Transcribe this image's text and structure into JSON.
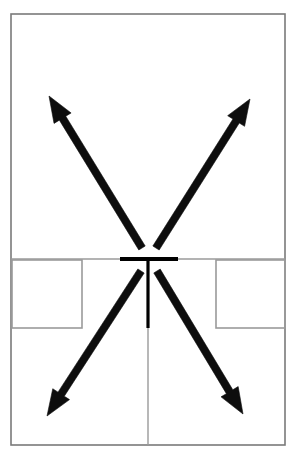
{
  "diagram": {
    "canvas": {
      "width": 296,
      "height": 458,
      "background_color": "#ffffff"
    },
    "colors": {
      "outline": "#7a7a7a",
      "wall_light": "#9a9a9a",
      "wall_dark": "#000000",
      "arrow": "#0d0d0d",
      "background": "#ffffff"
    },
    "outer_wall": {
      "name": "building-outline",
      "x": 11,
      "y": 14,
      "width": 274,
      "height": 431,
      "stroke_width": 1.6
    },
    "partition_wall": {
      "name": "central-partition",
      "y": 259,
      "x_start": 11,
      "x_end": 285,
      "stroke_width": 1.6
    },
    "doorway": {
      "name": "central-doorway",
      "bar_x_start": 120,
      "bar_x_end": 178,
      "bar_y": 259,
      "bar_thickness": 4,
      "stem_x": 148,
      "stem_y_start": 259,
      "stem_y_end": 328,
      "stem_thickness": 3.2
    },
    "center_guide": {
      "name": "center-axis-guide",
      "x": 148,
      "y_start": 328,
      "y_end": 445,
      "stroke_width": 1.4
    },
    "alcoves": [
      {
        "name": "alcove-left",
        "x": 12,
        "y": 260,
        "width": 70,
        "height": 68,
        "stroke_width": 1.6
      },
      {
        "name": "alcove-right",
        "x": 216,
        "y": 260,
        "width": 69,
        "height": 68,
        "stroke_width": 1.6
      }
    ],
    "arrows": [
      {
        "name": "arrow-up-left",
        "direction": "up-left",
        "tail_x": 142,
        "tail_y": 248,
        "tip_x": 49,
        "tip_y": 96,
        "shaft_width": 7.5,
        "head_length": 26,
        "head_width": 20
      },
      {
        "name": "arrow-up-right",
        "direction": "up-right",
        "tail_x": 156,
        "tail_y": 248,
        "tip_x": 250,
        "tip_y": 99,
        "shaft_width": 7.5,
        "head_length": 26,
        "head_width": 20
      },
      {
        "name": "arrow-down-left",
        "direction": "down-left",
        "tail_x": 141,
        "tail_y": 271,
        "tip_x": 47,
        "tip_y": 416,
        "shaft_width": 7.5,
        "head_length": 26,
        "head_width": 20
      },
      {
        "name": "arrow-down-right",
        "direction": "down-right",
        "tail_x": 157,
        "tail_y": 271,
        "tip_x": 243,
        "tip_y": 414,
        "shaft_width": 7.5,
        "head_length": 26,
        "head_width": 20
      }
    ]
  }
}
